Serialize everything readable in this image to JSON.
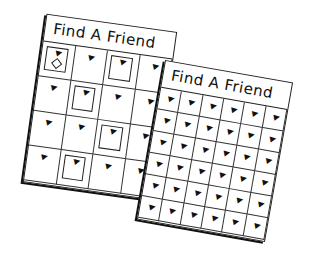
{
  "sheets": [
    {
      "title": "Find A Friend",
      "rows": 4,
      "cols": 4
    },
    {
      "title": "Find A Friend",
      "rows": 6,
      "cols": 6
    }
  ],
  "icons": {
    "pin": "pushpin-icon"
  }
}
